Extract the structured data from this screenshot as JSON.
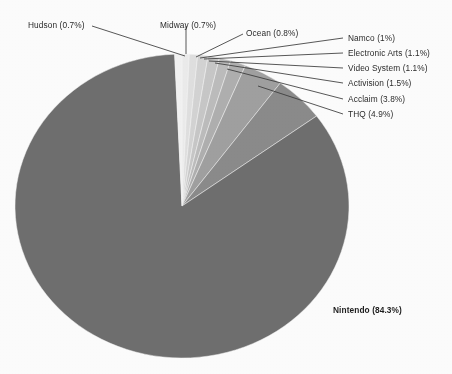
{
  "chart_data": {
    "type": "pie",
    "title": "",
    "labels": [
      "Midway (0.7%)",
      "Ocean (0.8%)",
      "Namco (1%)",
      "Electronic Arts (1.1%)",
      "Video System (1.1%)",
      "Activision (1.5%)",
      "Acclaim (3.8%)",
      "THQ (4.9%)",
      "Nintendo (84.3%)",
      "Hudson (0.7%)"
    ],
    "categories": [
      "Midway",
      "Ocean",
      "Namco",
      "Electronic Arts",
      "Video System",
      "Activision",
      "Acclaim",
      "THQ",
      "Nintendo",
      "Hudson"
    ],
    "values": [
      0.7,
      0.8,
      1.0,
      1.1,
      1.1,
      1.5,
      3.8,
      4.9,
      84.3,
      0.7
    ],
    "unit": "%",
    "start_angle_deg": 0,
    "direction": "clockwise",
    "legend": "none",
    "grid": false,
    "slice_colors": [
      "#ececec",
      "#e0e0e0",
      "#d4d4d4",
      "#c8c8c8",
      "#bdbdbd",
      "#b0b0b0",
      "#a0a0a0",
      "#8b8b8b",
      "#6f6f6f",
      "#f2f2f2"
    ],
    "slices": [
      {
        "name": "Midway",
        "label": "Midway (0.7%)",
        "value": 0.7,
        "color": "#ececec"
      },
      {
        "name": "Ocean",
        "label": "Ocean (0.8%)",
        "value": 0.8,
        "color": "#e0e0e0"
      },
      {
        "name": "Namco",
        "label": "Namco (1%)",
        "value": 1.0,
        "color": "#d4d4d4"
      },
      {
        "name": "Electronic Arts",
        "label": "Electronic Arts (1.1%)",
        "value": 1.1,
        "color": "#c8c8c8"
      },
      {
        "name": "Video System",
        "label": "Video System (1.1%)",
        "value": 1.1,
        "color": "#bdbdbd"
      },
      {
        "name": "Activision",
        "label": "Activision (1.5%)",
        "value": 1.5,
        "color": "#b0b0b0"
      },
      {
        "name": "Acclaim",
        "label": "Acclaim (3.8%)",
        "value": 3.8,
        "color": "#a0a0a0"
      },
      {
        "name": "THQ",
        "label": "THQ (4.9%)",
        "value": 4.9,
        "color": "#8b8b8b"
      },
      {
        "name": "Nintendo",
        "label": "Nintendo (84.3%)",
        "value": 84.3,
        "color": "#6f6f6f"
      },
      {
        "name": "Hudson",
        "label": "Hudson (0.7%)",
        "value": 0.7,
        "color": "#f2f2f2"
      }
    ]
  },
  "annotations": {
    "hudson": "Hudson (0.7%)",
    "midway": "Midway (0.7%)",
    "ocean": "Ocean (0.8%)",
    "namco": "Namco (1%)",
    "electronic_arts": "Electronic Arts (1.1%)",
    "video_system": "Video System (1.1%)",
    "activision": "Activision (1.5%)",
    "acclaim": "Acclaim (3.8%)",
    "thq": "THQ (4.9%)",
    "nintendo": "Nintendo (84.3%)"
  },
  "colors": {
    "background": "#fdfdfd",
    "leader_line": "#3a3a3a",
    "text": "#2b2b2b",
    "largest_slice": "#6f6f6f"
  }
}
